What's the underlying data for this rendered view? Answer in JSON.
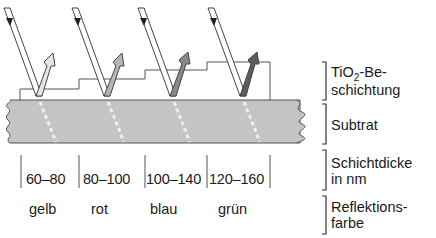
{
  "legend": {
    "coating": {
      "prefix": "TiO",
      "subscript": "2",
      "suffix": "-Be-",
      "line2": "schichtung"
    },
    "substrate": "Subtrat",
    "thickness": {
      "line1": "Schichtdicke",
      "line2": "in nm"
    },
    "reflection": {
      "line1": "Reflektions-",
      "line2": "farbe"
    }
  },
  "columns": [
    {
      "thickness": "60–80",
      "color_name": "gelb",
      "arrow_color": "#e6e6e6"
    },
    {
      "thickness": "80–100",
      "color_name": "rot",
      "arrow_color": "#b5b5b5"
    },
    {
      "thickness": "100–140",
      "color_name": "blau",
      "arrow_color": "#8a8a8a"
    },
    {
      "thickness": "120–160",
      "color_name": "grün",
      "arrow_color": "#5c5c5c"
    }
  ],
  "colors": {
    "substrate_fill": "#c4c4c4",
    "outline": "#555555"
  }
}
